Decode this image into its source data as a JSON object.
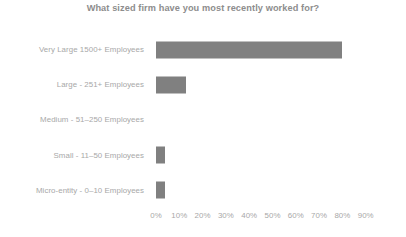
{
  "chart_data": {
    "type": "bar",
    "orientation": "horizontal",
    "title": "What sized firm have you most recently worked for?",
    "xlabel": "",
    "ylabel": "",
    "categories": [
      "Very Large 1500+ Employees",
      "Large - 251+ Employees",
      "Medium - 51–250 Employees",
      "Small - 11–50 Employees",
      "Micro-entity - 0–10 Employees"
    ],
    "values": [
      80,
      13,
      0,
      4,
      4
    ],
    "value_suffix": "%",
    "xlim": [
      0,
      90
    ],
    "xticks": [
      0,
      10,
      20,
      30,
      40,
      50,
      60,
      70,
      80,
      90
    ],
    "xtick_labels": [
      "0%",
      "10%",
      "20%",
      "30%",
      "40%",
      "50%",
      "60%",
      "70%",
      "80%",
      "90%"
    ],
    "grid": false,
    "legend": false,
    "bar_color": "#808080",
    "title_color": "#8d8d8d",
    "label_color": "#a8a8a8",
    "background": "#ffffff"
  }
}
